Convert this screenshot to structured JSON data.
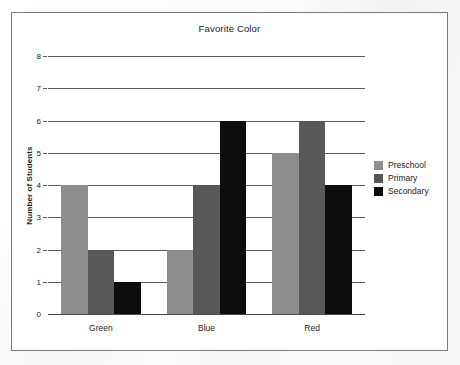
{
  "chart_data": {
    "type": "bar",
    "title": "Favorite Color",
    "xlabel": "",
    "ylabel": "Number of Students",
    "categories": [
      "Green",
      "Blue",
      "Red"
    ],
    "series": [
      {
        "name": "Preschool",
        "color": "#8d8d8d",
        "values": [
          4,
          2,
          5
        ]
      },
      {
        "name": "Primary",
        "color": "#585858",
        "values": [
          2,
          4,
          6
        ]
      },
      {
        "name": "Secondary",
        "color": "#0d0d0d",
        "values": [
          1,
          6,
          4
        ]
      }
    ],
    "ylim": [
      0,
      8
    ],
    "ytick_labels": [
      "0",
      "1",
      "2",
      "3",
      "4",
      "5",
      "6",
      "7",
      "8"
    ],
    "ytick_values": [
      0,
      1,
      2,
      3,
      4,
      5,
      6,
      7,
      8
    ],
    "grid": true,
    "grid_axis": "y",
    "legend_position": "right",
    "bar_grouping": "grouped",
    "bars_contiguous_within_group": true
  },
  "legend": {
    "entries": [
      {
        "label": "Preschool",
        "color": "#8d8d8d"
      },
      {
        "label": "Primary",
        "color": "#585858"
      },
      {
        "label": "Secondary",
        "color": "#0d0d0d"
      }
    ]
  },
  "style": {
    "frame_border_color": "#7b7b7e",
    "gridline_color": "#5c5c5e",
    "axis_color": "#4a4a4c",
    "text_color": "#1d1d1d",
    "background": "#ffffff"
  }
}
